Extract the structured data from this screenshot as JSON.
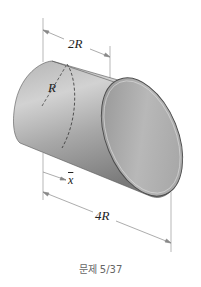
{
  "figure": {
    "type": "engineering-statics-diagram",
    "labels": {
      "top_dimension": "2R",
      "radius": "R",
      "centroid": "x",
      "bottom_dimension": "4R"
    },
    "colors": {
      "cylinder_light": "#c9c9c9",
      "cylinder_mid": "#9a9a9a",
      "cylinder_dark": "#6e6e6e",
      "dimension_line": "#888888",
      "text": "#222222"
    }
  },
  "caption": "문제 5/37"
}
